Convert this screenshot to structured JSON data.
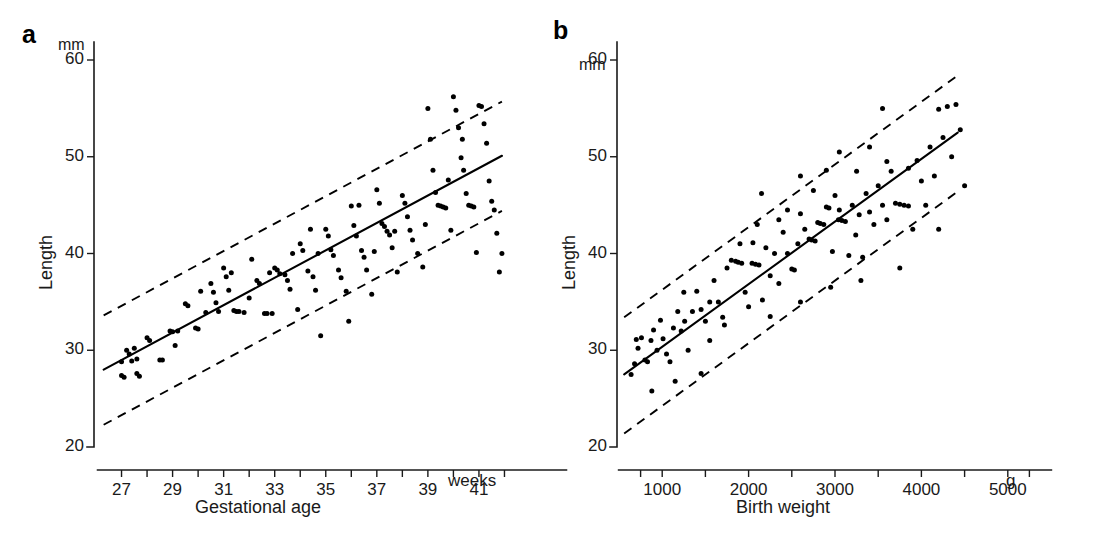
{
  "figure": {
    "background_color": "#ffffff",
    "ink_color": "#000000",
    "width": 1103,
    "height": 539
  },
  "chart_data": [
    {
      "type": "scatter",
      "panel_letter": "a",
      "title": "",
      "xlabel": "Gestational age",
      "x_unit": "weeks",
      "ylabel": "Length",
      "y_unit": "mm",
      "xlim": [
        26,
        43
      ],
      "ylim": [
        20,
        60
      ],
      "xticks": [
        27,
        28,
        29,
        30,
        31,
        32,
        33,
        34,
        35,
        36,
        37,
        38,
        39,
        40,
        41,
        42
      ],
      "xtick_labels": [
        "27",
        "",
        "29",
        "",
        "31",
        "",
        "33",
        "",
        "35",
        "",
        "37",
        "",
        "39",
        "",
        "41",
        ""
      ],
      "yticks": [
        20,
        30,
        40,
        50,
        60
      ],
      "ytick_labels": [
        "20",
        "30",
        "40",
        "50",
        "60"
      ],
      "grid": false,
      "legend": "none",
      "regression_line": {
        "label": "regression line",
        "style": "solid",
        "x": [
          26.3,
          41.9
        ],
        "y": [
          28.0,
          50.1
        ]
      },
      "upper_band": {
        "label": "upper prediction limit",
        "style": "dashed",
        "x": [
          26.3,
          41.9
        ],
        "y": [
          33.6,
          55.7
        ]
      },
      "lower_band": {
        "label": "lower prediction limit",
        "style": "dashed",
        "x": [
          26.3,
          41.9
        ],
        "y": [
          22.3,
          44.4
        ]
      },
      "points": [
        [
          27.0,
          28.8
        ],
        [
          27.0,
          27.4
        ],
        [
          27.1,
          27.2
        ],
        [
          27.2,
          30.0
        ],
        [
          27.3,
          29.6
        ],
        [
          27.4,
          28.9
        ],
        [
          27.5,
          30.2
        ],
        [
          27.6,
          29.1
        ],
        [
          27.6,
          27.6
        ],
        [
          27.7,
          27.3
        ],
        [
          28.0,
          31.3
        ],
        [
          28.1,
          31.0
        ],
        [
          28.5,
          29.0
        ],
        [
          28.6,
          29.0
        ],
        [
          28.9,
          32.0
        ],
        [
          29.0,
          31.9
        ],
        [
          29.1,
          30.5
        ],
        [
          29.5,
          34.8
        ],
        [
          29.6,
          34.6
        ],
        [
          29.9,
          32.3
        ],
        [
          30.0,
          32.2
        ],
        [
          30.3,
          33.9
        ],
        [
          30.5,
          36.9
        ],
        [
          30.6,
          36.0
        ],
        [
          30.7,
          34.9
        ],
        [
          30.8,
          34.0
        ],
        [
          31.0,
          38.5
        ],
        [
          31.1,
          37.6
        ],
        [
          31.2,
          36.2
        ],
        [
          31.4,
          34.1
        ],
        [
          31.5,
          34.0
        ],
        [
          31.6,
          34.0
        ],
        [
          31.8,
          33.9
        ],
        [
          32.0,
          35.4
        ],
        [
          32.1,
          39.4
        ],
        [
          32.3,
          37.2
        ],
        [
          32.4,
          36.9
        ],
        [
          32.6,
          33.8
        ],
        [
          32.7,
          33.8
        ],
        [
          32.9,
          33.8
        ],
        [
          33.0,
          38.5
        ],
        [
          33.1,
          38.3
        ],
        [
          33.2,
          37.9
        ],
        [
          33.4,
          37.8
        ],
        [
          33.5,
          37.2
        ],
        [
          33.6,
          36.3
        ],
        [
          33.9,
          34.2
        ],
        [
          34.0,
          41.0
        ],
        [
          34.1,
          40.3
        ],
        [
          34.3,
          38.2
        ],
        [
          34.5,
          37.6
        ],
        [
          34.6,
          36.2
        ],
        [
          34.8,
          31.5
        ],
        [
          35.0,
          42.5
        ],
        [
          35.1,
          41.8
        ],
        [
          35.2,
          40.4
        ],
        [
          35.3,
          39.8
        ],
        [
          35.5,
          38.3
        ],
        [
          35.6,
          37.5
        ],
        [
          35.8,
          36.1
        ],
        [
          36.0,
          44.9
        ],
        [
          36.1,
          42.9
        ],
        [
          36.2,
          41.8
        ],
        [
          36.4,
          40.3
        ],
        [
          36.5,
          39.6
        ],
        [
          36.6,
          38.3
        ],
        [
          36.8,
          35.8
        ],
        [
          37.0,
          46.6
        ],
        [
          37.1,
          45.2
        ],
        [
          37.2,
          43.1
        ],
        [
          37.3,
          42.8
        ],
        [
          37.4,
          42.3
        ],
        [
          37.5,
          41.9
        ],
        [
          37.6,
          40.6
        ],
        [
          37.8,
          38.1
        ],
        [
          38.0,
          46.0
        ],
        [
          38.1,
          45.2
        ],
        [
          38.2,
          43.8
        ],
        [
          38.3,
          42.4
        ],
        [
          38.4,
          41.4
        ],
        [
          38.6,
          40.0
        ],
        [
          38.8,
          38.6
        ],
        [
          39.0,
          55.0
        ],
        [
          39.1,
          51.8
        ],
        [
          39.2,
          48.6
        ],
        [
          39.3,
          46.3
        ],
        [
          39.4,
          45.0
        ],
        [
          39.5,
          44.9
        ],
        [
          39.6,
          44.8
        ],
        [
          39.7,
          44.7
        ],
        [
          39.9,
          42.4
        ],
        [
          40.0,
          56.2
        ],
        [
          40.1,
          54.8
        ],
        [
          40.2,
          53.0
        ],
        [
          40.3,
          49.9
        ],
        [
          40.4,
          48.6
        ],
        [
          40.5,
          46.2
        ],
        [
          40.6,
          45.0
        ],
        [
          40.7,
          44.9
        ],
        [
          40.8,
          44.8
        ],
        [
          40.9,
          40.1
        ],
        [
          41.0,
          55.3
        ],
        [
          41.1,
          55.2
        ],
        [
          41.2,
          53.4
        ],
        [
          41.3,
          51.4
        ],
        [
          41.4,
          47.5
        ],
        [
          41.5,
          45.4
        ],
        [
          41.6,
          44.5
        ],
        [
          41.7,
          42.1
        ],
        [
          41.8,
          38.1
        ],
        [
          41.9,
          40.0
        ],
        [
          34.7,
          40.0
        ],
        [
          36.9,
          40.2
        ],
        [
          33.7,
          40.0
        ],
        [
          35.9,
          33.0
        ],
        [
          38.9,
          43.0
        ],
        [
          32.8,
          38.0
        ],
        [
          30.1,
          36.1
        ],
        [
          29.2,
          32.0
        ],
        [
          31.3,
          38.0
        ],
        [
          37.7,
          42.3
        ],
        [
          34.4,
          42.5
        ],
        [
          36.3,
          45.0
        ],
        [
          39.8,
          47.6
        ],
        [
          40.35,
          51.8
        ]
      ]
    },
    {
      "type": "scatter",
      "panel_letter": "b",
      "title": "",
      "xlabel": "Birth weight",
      "x_unit": "g",
      "ylabel": "Length",
      "y_unit": "mm",
      "xlim": [
        500,
        5500
      ],
      "ylim": [
        20,
        60
      ],
      "xticks": [
        750,
        1000,
        1500,
        2000,
        2500,
        3000,
        3500,
        4000,
        4500,
        5000,
        5250
      ],
      "xtick_labels": [
        "",
        "1000",
        "",
        "2000",
        "",
        "3000",
        "",
        "4000",
        "",
        "5000",
        ""
      ],
      "yticks": [
        20,
        30,
        40,
        50,
        60
      ],
      "ytick_labels": [
        "20",
        "30",
        "40",
        "50",
        "60"
      ],
      "grid": false,
      "legend": "none",
      "regression_line": {
        "label": "regression line",
        "style": "solid",
        "x": [
          560,
          4420
        ],
        "y": [
          27.5,
          52.5
        ]
      },
      "upper_band": {
        "label": "upper prediction limit",
        "style": "dashed",
        "x": [
          560,
          4420
        ],
        "y": [
          33.4,
          58.4
        ]
      },
      "lower_band": {
        "label": "lower prediction limit",
        "style": "dashed",
        "x": [
          560,
          4420
        ],
        "y": [
          21.4,
          46.4
        ]
      },
      "points": [
        [
          640,
          27.5
        ],
        [
          680,
          28.6
        ],
        [
          700,
          31.1
        ],
        [
          720,
          30.2
        ],
        [
          760,
          31.3
        ],
        [
          800,
          29.0
        ],
        [
          830,
          28.8
        ],
        [
          870,
          31.0
        ],
        [
          900,
          32.1
        ],
        [
          940,
          30.0
        ],
        [
          980,
          33.1
        ],
        [
          1010,
          31.2
        ],
        [
          1050,
          29.6
        ],
        [
          1090,
          28.8
        ],
        [
          1130,
          32.3
        ],
        [
          1180,
          34.0
        ],
        [
          1220,
          32.0
        ],
        [
          1260,
          33.0
        ],
        [
          1300,
          30.0
        ],
        [
          1350,
          34.0
        ],
        [
          1400,
          36.1
        ],
        [
          1450,
          34.2
        ],
        [
          1500,
          33.0
        ],
        [
          1550,
          35.0
        ],
        [
          1600,
          37.2
        ],
        [
          1650,
          35.0
        ],
        [
          1700,
          33.4
        ],
        [
          1750,
          38.5
        ],
        [
          1800,
          39.3
        ],
        [
          1850,
          39.2
        ],
        [
          1880,
          39.1
        ],
        [
          1920,
          39.0
        ],
        [
          1960,
          36.0
        ],
        [
          2000,
          34.5
        ],
        [
          2040,
          39.0
        ],
        [
          2080,
          38.9
        ],
        [
          2120,
          38.8
        ],
        [
          2160,
          35.2
        ],
        [
          2200,
          40.6
        ],
        [
          2250,
          37.7
        ],
        [
          2300,
          40.0
        ],
        [
          2350,
          36.9
        ],
        [
          2400,
          42.2
        ],
        [
          2450,
          40.0
        ],
        [
          2500,
          38.4
        ],
        [
          2530,
          38.3
        ],
        [
          2570,
          41.0
        ],
        [
          2600,
          44.1
        ],
        [
          2650,
          42.5
        ],
        [
          2700,
          41.5
        ],
        [
          2730,
          41.4
        ],
        [
          2770,
          41.3
        ],
        [
          2800,
          43.2
        ],
        [
          2830,
          43.1
        ],
        [
          2870,
          43.0
        ],
        [
          2900,
          44.8
        ],
        [
          2930,
          44.7
        ],
        [
          2970,
          40.2
        ],
        [
          3000,
          46.0
        ],
        [
          3040,
          43.5
        ],
        [
          3080,
          43.4
        ],
        [
          3120,
          43.3
        ],
        [
          3160,
          39.8
        ],
        [
          3200,
          45.0
        ],
        [
          3240,
          41.9
        ],
        [
          3280,
          44.0
        ],
        [
          3320,
          39.6
        ],
        [
          3360,
          46.2
        ],
        [
          3400,
          44.3
        ],
        [
          3450,
          43.0
        ],
        [
          3500,
          47.0
        ],
        [
          3550,
          45.0
        ],
        [
          3600,
          43.5
        ],
        [
          3650,
          48.5
        ],
        [
          3700,
          45.2
        ],
        [
          3750,
          45.1
        ],
        [
          3800,
          45.0
        ],
        [
          3850,
          44.9
        ],
        [
          3900,
          42.5
        ],
        [
          3950,
          49.6
        ],
        [
          4000,
          47.5
        ],
        [
          4050,
          45.0
        ],
        [
          4100,
          51.0
        ],
        [
          4150,
          48.0
        ],
        [
          4200,
          54.9
        ],
        [
          4250,
          52.0
        ],
        [
          4300,
          55.2
        ],
        [
          4350,
          50.0
        ],
        [
          4400,
          55.4
        ],
        [
          4450,
          52.8
        ],
        [
          2150,
          46.2
        ],
        [
          2600,
          48.0
        ],
        [
          3050,
          50.5
        ],
        [
          3400,
          51.0
        ],
        [
          3550,
          55.0
        ],
        [
          2900,
          48.6
        ],
        [
          3250,
          48.5
        ],
        [
          2450,
          44.5
        ],
        [
          1900,
          41.0
        ],
        [
          2050,
          41.1
        ],
        [
          1250,
          36.0
        ],
        [
          1550,
          31.0
        ],
        [
          1720,
          32.6
        ],
        [
          2250,
          33.5
        ],
        [
          2600,
          35.0
        ],
        [
          2950,
          36.5
        ],
        [
          3300,
          37.2
        ],
        [
          3750,
          38.5
        ],
        [
          4200,
          42.5
        ],
        [
          1450,
          27.6
        ],
        [
          1150,
          26.8
        ],
        [
          880,
          25.8
        ],
        [
          2100,
          43.0
        ],
        [
          2350,
          43.5
        ],
        [
          3850,
          48.8
        ],
        [
          3050,
          44.5
        ],
        [
          2750,
          46.5
        ],
        [
          3600,
          49.5
        ],
        [
          4500,
          47.0
        ]
      ]
    }
  ],
  "panel_a": {
    "letter": "a",
    "y_unit": "mm",
    "y_title": "Length",
    "x_title": "Gestational age",
    "x_unit": "weeks",
    "ytick_labels": [
      "60",
      "50",
      "40",
      "30",
      "20"
    ],
    "xtick_labels": [
      "27",
      "29",
      "31",
      "33",
      "35",
      "37",
      "39",
      "41"
    ]
  },
  "panel_b": {
    "letter": "b",
    "y_unit": "mm",
    "y_title": "Length",
    "x_title": "Birth weight",
    "x_unit": "g",
    "ytick_labels": [
      "60",
      "50",
      "40",
      "30",
      "20"
    ],
    "xtick_labels": [
      "1000",
      "2000",
      "3000",
      "4000",
      "5000"
    ]
  }
}
